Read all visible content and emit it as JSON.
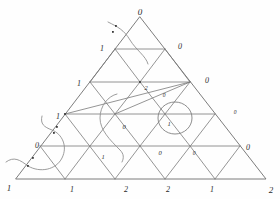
{
  "figure": {
    "type": "diagram",
    "rows": 5,
    "stroke_color": "#7a7a7a",
    "label_color": "#2b2b2b",
    "background": "#fefefe"
  },
  "vertices": [
    {
      "id": "v-0-0",
      "label": "0",
      "x": 140,
      "y": 12,
      "kind": "apex",
      "size": "corner"
    },
    {
      "id": "v-1-0",
      "label": "1",
      "x": 102,
      "y": 49,
      "kind": "left-edge",
      "size": "edge"
    },
    {
      "id": "v-1-1",
      "label": "0",
      "x": 180,
      "y": 47,
      "kind": "right-edge",
      "size": "edge"
    },
    {
      "id": "v-2-0",
      "label": "1",
      "x": 79,
      "y": 84,
      "kind": "left-edge",
      "size": "edge"
    },
    {
      "id": "v-2-1",
      "label": "2",
      "x": 146,
      "y": 88,
      "kind": "interior",
      "size": "in"
    },
    {
      "id": "v-2-2",
      "label": "0",
      "x": 207,
      "y": 81,
      "kind": "right-edge",
      "size": "edge"
    },
    {
      "id": "v-2-1b",
      "label": "0",
      "x": 164,
      "y": 96,
      "kind": "interior",
      "size": "small"
    },
    {
      "id": "v-3-0",
      "label": "1",
      "x": 58,
      "y": 117,
      "kind": "left-edge",
      "size": "edge"
    },
    {
      "id": "v-3-1",
      "label": "0",
      "x": 124,
      "y": 127,
      "kind": "interior",
      "size": "in"
    },
    {
      "id": "v-3-2",
      "label": "1",
      "x": 169,
      "y": 124,
      "kind": "circled",
      "size": "in"
    },
    {
      "id": "v-3-3",
      "label": "0",
      "x": 235,
      "y": 113,
      "kind": "right-edge",
      "size": "small"
    },
    {
      "id": "v-4-0",
      "label": "0",
      "x": 37,
      "y": 146,
      "kind": "left-edge",
      "size": "edge"
    },
    {
      "id": "v-4-1",
      "label": "1",
      "x": 103,
      "y": 157,
      "kind": "interior",
      "size": "in"
    },
    {
      "id": "v-4-2",
      "label": "0",
      "x": 160,
      "y": 153,
      "kind": "interior",
      "size": "in"
    },
    {
      "id": "v-4-3",
      "label": "0",
      "x": 194,
      "y": 154,
      "kind": "interior",
      "size": "small"
    },
    {
      "id": "v-4-4",
      "label": "0",
      "x": 248,
      "y": 148,
      "kind": "right-edge",
      "size": "edge"
    },
    {
      "id": "v-5-0",
      "label": "1",
      "x": 9,
      "y": 188,
      "kind": "corner",
      "size": "corner"
    },
    {
      "id": "v-5-1",
      "label": "1",
      "x": 72,
      "y": 190,
      "kind": "bottom",
      "size": "edge"
    },
    {
      "id": "v-5-2",
      "label": "2",
      "x": 126,
      "y": 190,
      "kind": "bottom",
      "size": "edge"
    },
    {
      "id": "v-5-3",
      "label": "2",
      "x": 168,
      "y": 190,
      "kind": "bottom",
      "size": "edge"
    },
    {
      "id": "v-5-4",
      "label": "1",
      "x": 212,
      "y": 190,
      "kind": "bottom",
      "size": "edge"
    },
    {
      "id": "v-5-5",
      "label": "2",
      "x": 271,
      "y": 190,
      "kind": "corner",
      "size": "corner"
    }
  ],
  "grid": {
    "apex": {
      "x": 140,
      "y": 17
    },
    "left": {
      "x": 16,
      "y": 179
    },
    "right": {
      "x": 266,
      "y": 179
    },
    "row_count": 5,
    "note": "equilateral-ish triangulation subdivided into 25 small triangles"
  },
  "marked_points": [
    {
      "x": 116,
      "y": 26
    },
    {
      "x": 113,
      "y": 31
    },
    {
      "x": 57,
      "y": 127
    },
    {
      "x": 54,
      "y": 133
    },
    {
      "x": 33,
      "y": 158
    },
    {
      "x": 28,
      "y": 166
    }
  ],
  "circled_vertices": [
    {
      "cx": 174,
      "cy": 118,
      "r": 16,
      "label": "1"
    }
  ],
  "edge_labels_summary": {
    "left_edge_top_to_bottom": [
      "0",
      "1",
      "1",
      "1",
      "0",
      "1"
    ],
    "right_edge_top_to_bottom": [
      "0",
      "0",
      "0",
      "0",
      "0",
      "2"
    ],
    "bottom_edge_left_to_right": [
      "1",
      "1",
      "2",
      "2",
      "1",
      "2"
    ],
    "interior": [
      "2",
      "0",
      "0",
      "1",
      "1",
      "0",
      "0"
    ]
  }
}
